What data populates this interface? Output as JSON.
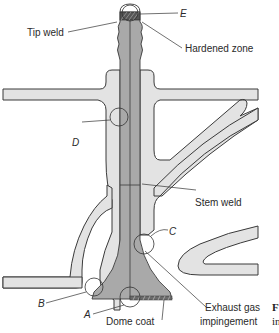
{
  "figure": {
    "colors": {
      "cylinder_head": "#e3e3e3",
      "valve": "#a9a9a9",
      "outline": "#3a3a3a",
      "text": "#2a2a2a"
    },
    "labels": {
      "tip_weld": "Tip weld",
      "hardened_zone": "Hardened zone",
      "stem_weld": "Stem weld",
      "exhaust_gas": "Exhaust gas",
      "impingement": "impingement",
      "dome_coat": "Dome coat"
    },
    "zones": {
      "a": "A",
      "b": "B",
      "c": "C",
      "d": "D",
      "e": "E"
    },
    "caption_fragment": {
      "line1": "F",
      "line2": "in"
    }
  }
}
